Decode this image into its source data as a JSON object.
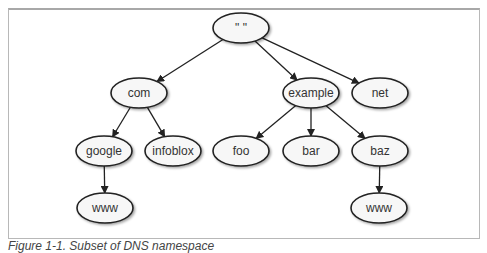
{
  "figure": {
    "caption": "Figure 1-1. Subset of DNS namespace"
  },
  "colors": {
    "node_fill": "#f7f7f7",
    "node_stroke": "#222222",
    "edge": "#222222",
    "frame_border": "#b8b8b8"
  },
  "nodes": [
    {
      "id": "root",
      "label": "\" \"",
      "cx": 241,
      "cy": 28
    },
    {
      "id": "com",
      "label": "com",
      "cx": 139,
      "cy": 93
    },
    {
      "id": "example",
      "label": "example",
      "cx": 311,
      "cy": 93
    },
    {
      "id": "net",
      "label": "net",
      "cx": 380,
      "cy": 93
    },
    {
      "id": "google",
      "label": "google",
      "cx": 104,
      "cy": 151
    },
    {
      "id": "infoblox",
      "label": "infoblox",
      "cx": 173,
      "cy": 151
    },
    {
      "id": "foo",
      "label": "foo",
      "cx": 241,
      "cy": 151
    },
    {
      "id": "bar",
      "label": "bar",
      "cx": 311,
      "cy": 151
    },
    {
      "id": "baz",
      "label": "baz",
      "cx": 380,
      "cy": 151
    },
    {
      "id": "www-google",
      "label": "www",
      "cx": 105,
      "cy": 208
    },
    {
      "id": "www-baz",
      "label": "www",
      "cx": 379,
      "cy": 208
    }
  ],
  "edges": [
    {
      "from": "root",
      "to": "com"
    },
    {
      "from": "root",
      "to": "example"
    },
    {
      "from": "root",
      "to": "net"
    },
    {
      "from": "com",
      "to": "google"
    },
    {
      "from": "com",
      "to": "infoblox"
    },
    {
      "from": "example",
      "to": "foo"
    },
    {
      "from": "example",
      "to": "bar"
    },
    {
      "from": "example",
      "to": "baz"
    },
    {
      "from": "google",
      "to": "www-google"
    },
    {
      "from": "baz",
      "to": "www-baz"
    }
  ]
}
